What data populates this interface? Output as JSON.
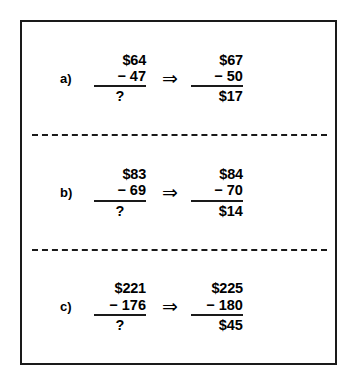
{
  "figure": {
    "border_color": "#1a1a1a",
    "background_color": "#ffffff",
    "divider_style": "dashed",
    "arrow_glyph": "⇒",
    "unknown_symbol": "?",
    "minus_symbol": "−",
    "rows": [
      {
        "label": "a)",
        "original": {
          "minuend": "$64",
          "operator": "−",
          "subtrahend": "47",
          "answer": "?"
        },
        "transformed": {
          "minuend": "$67",
          "operator": "−",
          "subtrahend": "50",
          "answer": "$17"
        }
      },
      {
        "label": "b)",
        "original": {
          "minuend": "$83",
          "operator": "−",
          "subtrahend": "69",
          "answer": "?"
        },
        "transformed": {
          "minuend": "$84",
          "operator": "−",
          "subtrahend": "70",
          "answer": "$14"
        }
      },
      {
        "label": "c)",
        "original": {
          "minuend": "$221",
          "operator": "−",
          "subtrahend": "176",
          "answer": "?"
        },
        "transformed": {
          "minuend": "$225",
          "operator": "−",
          "subtrahend": "180",
          "answer": "$45"
        }
      }
    ]
  }
}
